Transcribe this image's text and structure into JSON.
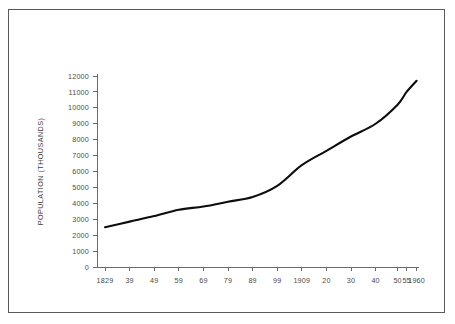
{
  "chart_data": {
    "type": "line",
    "title": "",
    "xlabel": "",
    "ylabel": "POPULATION (THOUSANDS)",
    "grid": false,
    "legend": "none",
    "ylim": [
      0,
      12000
    ],
    "y_ticks": [
      0,
      1000,
      2000,
      3000,
      4000,
      5000,
      6000,
      7000,
      8000,
      9000,
      10000,
      11000,
      12000
    ],
    "y_tick_labels": [
      "0",
      "1000",
      "2000",
      "3000",
      "4000",
      "5000",
      "6000",
      "7000",
      "8000",
      "9000",
      "10000",
      "11000",
      "12000"
    ],
    "x_tick_labels": [
      "1829",
      "39",
      "49",
      "59",
      "69",
      "79",
      "89",
      "99",
      "1909",
      "20",
      "30",
      "40",
      "50",
      "55",
      "1960"
    ],
    "x": [
      1829,
      1839,
      1849,
      1859,
      1869,
      1879,
      1889,
      1899,
      1909,
      1920,
      1930,
      1940,
      1950,
      1955,
      1960
    ],
    "values": [
      2500,
      2850,
      3200,
      3600,
      3800,
      4100,
      4400,
      5100,
      6400,
      7300,
      8200,
      9000,
      10200,
      11000,
      11700
    ],
    "series": [
      {
        "name": "Population",
        "color": "#0d0d0d",
        "values": [
          2500,
          2850,
          3200,
          3600,
          3800,
          4100,
          4400,
          5100,
          6400,
          7300,
          8200,
          9000,
          10200,
          11000,
          11700
        ]
      }
    ]
  },
  "frame": {
    "border_color": "#5a5a5a",
    "background": "#ffffff"
  }
}
